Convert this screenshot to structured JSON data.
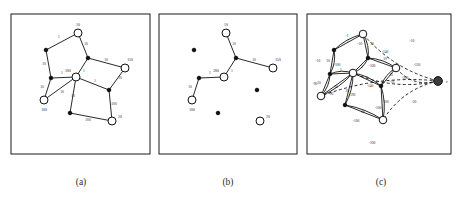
{
  "figure": {
    "width": 461,
    "height": 198,
    "background": "#ffffff",
    "ink": "#111111"
  },
  "captions": [
    {
      "id": "cap-a",
      "text": "(a)",
      "x": 81,
      "y": 185
    },
    {
      "id": "cap-b",
      "text": "(b)",
      "x": 228,
      "y": 185
    },
    {
      "id": "cap-c",
      "text": "(c)",
      "x": 381,
      "y": 185
    }
  ],
  "panels": [
    {
      "id": "panel-a",
      "caption": "(a)",
      "box": {
        "x": 11,
        "y": 14,
        "w": 139,
        "h": 140
      },
      "nodes": [
        {
          "id": "a-top",
          "x": 78,
          "y": 33,
          "type": "open",
          "r": 4.0,
          "label": "10",
          "lx": 78,
          "ly": 26
        },
        {
          "id": "a-ul",
          "x": 46,
          "y": 50,
          "type": "solid",
          "r": 1.8,
          "label": "",
          "lx": 0,
          "ly": 0
        },
        {
          "id": "a-mid",
          "x": 88,
          "y": 58,
          "type": "solid",
          "r": 1.8,
          "label": "",
          "lx": 0,
          "ly": 0
        },
        {
          "id": "a-right",
          "x": 125,
          "y": 68,
          "type": "open",
          "r": 4.0,
          "label": "150",
          "lx": 130,
          "ly": 61
        },
        {
          "id": "a-center",
          "x": 76,
          "y": 77,
          "type": "open",
          "r": 4.0,
          "label": "200",
          "lx": 68,
          "ly": 72
        },
        {
          "id": "a-left",
          "x": 51,
          "y": 78,
          "type": "solid",
          "r": 1.8,
          "label": "",
          "lx": 0,
          "ly": 0
        },
        {
          "id": "a-bl",
          "x": 44,
          "y": 100,
          "type": "open",
          "r": 4.0,
          "label": "100",
          "lx": 44,
          "ly": 111
        },
        {
          "id": "a-bc",
          "x": 70,
          "y": 113,
          "type": "solid",
          "r": 1.8,
          "label": "",
          "lx": 0,
          "ly": 0
        },
        {
          "id": "a-mr",
          "x": 109,
          "y": 90,
          "type": "solid",
          "r": 1.8,
          "label": "",
          "lx": 0,
          "ly": 0
        },
        {
          "id": "a-br",
          "x": 112,
          "y": 121,
          "type": "open",
          "r": 4.0,
          "label": "20",
          "lx": 120,
          "ly": 118
        }
      ],
      "edges": [
        {
          "from": "a-ul",
          "to": "a-top",
          "label": "1",
          "lx": 59,
          "ly": 38
        },
        {
          "from": "a-top",
          "to": "a-mid",
          "label": "10",
          "lx": 86,
          "ly": 45
        },
        {
          "from": "a-ul",
          "to": "a-left",
          "label": "10",
          "lx": 44,
          "ly": 65
        },
        {
          "from": "a-mid",
          "to": "a-right",
          "label": "10",
          "lx": 106,
          "ly": 61
        },
        {
          "from": "a-mid",
          "to": "a-center",
          "label": "1",
          "lx": 84,
          "ly": 72
        },
        {
          "from": "a-left",
          "to": "a-center",
          "label": "1",
          "lx": 62,
          "ly": 74
        },
        {
          "from": "a-left",
          "to": "a-bl",
          "label": "10",
          "lx": 42,
          "ly": 88
        },
        {
          "from": "a-center",
          "to": "a-bl",
          "label": "10",
          "lx": 62,
          "ly": 93
        },
        {
          "from": "a-center",
          "to": "a-bc",
          "label": "10",
          "lx": 73,
          "ly": 97
        },
        {
          "from": "a-center",
          "to": "a-mr",
          "label": "1",
          "lx": 95,
          "ly": 82
        },
        {
          "from": "a-mr",
          "to": "a-right",
          "label": "10",
          "lx": 120,
          "ly": 79
        },
        {
          "from": "a-mr",
          "to": "a-br",
          "label": "100",
          "lx": 114,
          "ly": 105
        },
        {
          "from": "a-bc",
          "to": "a-br",
          "label": "100",
          "lx": 88,
          "ly": 121
        }
      ]
    },
    {
      "id": "panel-b",
      "caption": "(b)",
      "box": {
        "x": 159,
        "y": 14,
        "w": 138,
        "h": 140
      },
      "nodes": [
        {
          "id": "b-top",
          "x": 226,
          "y": 33,
          "type": "open",
          "r": 4.0,
          "label": "10",
          "lx": 226,
          "ly": 26
        },
        {
          "id": "b-ul",
          "x": 194,
          "y": 50,
          "type": "solid",
          "r": 1.8,
          "label": "",
          "lx": 0,
          "ly": 0
        },
        {
          "id": "b-mid",
          "x": 236,
          "y": 58,
          "type": "solid",
          "r": 1.8,
          "label": "",
          "lx": 0,
          "ly": 0
        },
        {
          "id": "b-right",
          "x": 273,
          "y": 68,
          "type": "open",
          "r": 4.0,
          "label": "150",
          "lx": 278,
          "ly": 61
        },
        {
          "id": "b-center",
          "x": 224,
          "y": 77,
          "type": "open",
          "r": 4.0,
          "label": "200",
          "lx": 216,
          "ly": 72
        },
        {
          "id": "b-left",
          "x": 199,
          "y": 78,
          "type": "solid",
          "r": 1.8,
          "label": "",
          "lx": 0,
          "ly": 0
        },
        {
          "id": "b-bl",
          "x": 192,
          "y": 100,
          "type": "open",
          "r": 4.0,
          "label": "100",
          "lx": 192,
          "ly": 111
        },
        {
          "id": "b-bc",
          "x": 218,
          "y": 113,
          "type": "solid",
          "r": 1.8,
          "label": "",
          "lx": 0,
          "ly": 0
        },
        {
          "id": "b-mr",
          "x": 257,
          "y": 90,
          "type": "solid",
          "r": 1.8,
          "label": "",
          "lx": 0,
          "ly": 0
        },
        {
          "id": "b-br",
          "x": 260,
          "y": 121,
          "type": "open",
          "r": 4.0,
          "label": "20",
          "lx": 268,
          "ly": 118
        }
      ],
      "edges": [
        {
          "from": "b-top",
          "to": "b-mid",
          "label": "10",
          "lx": 234,
          "ly": 45
        },
        {
          "from": "b-mid",
          "to": "b-right",
          "label": "10",
          "lx": 254,
          "ly": 61
        },
        {
          "from": "b-mid",
          "to": "b-center",
          "label": "1",
          "lx": 232,
          "ly": 72
        },
        {
          "from": "b-left",
          "to": "b-center",
          "label": "1",
          "lx": 210,
          "ly": 74
        },
        {
          "from": "b-left",
          "to": "b-bl",
          "label": "10",
          "lx": 190,
          "ly": 88
        }
      ]
    },
    {
      "id": "panel-c",
      "caption": "(c)",
      "box": {
        "x": 307,
        "y": 14,
        "w": 144,
        "h": 140
      },
      "root": {
        "id": "c-root",
        "x": 438,
        "y": 81,
        "r": 4.4,
        "label": "r",
        "lx": 446,
        "ly": 83
      },
      "nodes": [
        {
          "id": "c-top",
          "x": 363,
          "y": 34,
          "type": "open",
          "r": 3.8,
          "label": "",
          "lx": 0,
          "ly": 0
        },
        {
          "id": "c-ul",
          "x": 334,
          "y": 50,
          "type": "solid",
          "r": 1.8,
          "label": "",
          "lx": 0,
          "ly": 0
        },
        {
          "id": "c-mid",
          "x": 368,
          "y": 58,
          "type": "solid",
          "r": 1.8,
          "label": "",
          "lx": 0,
          "ly": 0
        },
        {
          "id": "c-right",
          "x": 396,
          "y": 68,
          "type": "open",
          "r": 3.8,
          "label": "",
          "lx": 0,
          "ly": 0
        },
        {
          "id": "c-center",
          "x": 353,
          "y": 73,
          "type": "open",
          "r": 3.8,
          "label": "",
          "lx": 0,
          "ly": 0
        },
        {
          "id": "c-left",
          "x": 330,
          "y": 74,
          "type": "solid",
          "r": 1.8,
          "label": "",
          "lx": 0,
          "ly": 0
        },
        {
          "id": "c-bl",
          "x": 321,
          "y": 96,
          "type": "open",
          "r": 3.8,
          "label": "",
          "lx": 0,
          "ly": 0
        },
        {
          "id": "c-bc",
          "x": 345,
          "y": 105,
          "type": "solid",
          "r": 1.8,
          "label": "",
          "lx": 0,
          "ly": 0
        },
        {
          "id": "c-mr",
          "x": 381,
          "y": 86,
          "type": "solid",
          "r": 1.8,
          "label": "",
          "lx": 0,
          "ly": 0
        },
        {
          "id": "c-br",
          "x": 383,
          "y": 120,
          "type": "open",
          "r": 3.8,
          "label": "",
          "lx": 0,
          "ly": 0
        }
      ],
      "edges": [
        {
          "from": "c-ul",
          "to": "c-top",
          "label": "1",
          "lx": 348,
          "ly": 42,
          "style": "solid"
        },
        {
          "from": "c-top",
          "to": "c-mid",
          "label": "10",
          "lx": 372,
          "ly": 45,
          "style": "solid"
        },
        {
          "from": "c-ul",
          "to": "c-left",
          "label": "10",
          "lx": 328,
          "ly": 62,
          "style": "solid"
        },
        {
          "from": "c-mid",
          "to": "c-right",
          "label": "10",
          "lx": 385,
          "ly": 60,
          "style": "solid"
        },
        {
          "from": "c-mid",
          "to": "c-center",
          "label": "1",
          "lx": 362,
          "ly": 68,
          "style": "solid"
        },
        {
          "from": "c-left",
          "to": "c-center",
          "label": "1",
          "lx": 341,
          "ly": 71,
          "style": "solid"
        },
        {
          "from": "c-left",
          "to": "c-bl",
          "label": "10",
          "lx": 319,
          "ly": 84,
          "style": "solid"
        },
        {
          "from": "c-center",
          "to": "c-bl",
          "label": "10",
          "lx": 336,
          "ly": 88,
          "style": "solid"
        },
        {
          "from": "c-center",
          "to": "c-bc",
          "label": "10",
          "lx": 347,
          "ly": 92,
          "style": "solid"
        },
        {
          "from": "c-center",
          "to": "c-mr",
          "label": "1",
          "lx": 367,
          "ly": 79,
          "style": "solid"
        },
        {
          "from": "c-mr",
          "to": "c-right",
          "label": "10",
          "lx": 391,
          "ly": 76,
          "style": "solid"
        },
        {
          "from": "c-mr",
          "to": "c-br",
          "label": "100",
          "lx": 386,
          "ly": 103,
          "style": "solid"
        },
        {
          "from": "c-bc",
          "to": "c-br",
          "label": "60",
          "lx": 363,
          "ly": 113,
          "style": "solid"
        }
      ],
      "reverse_edges": [
        {
          "from": "c-top",
          "to": "c-ul",
          "label": "-1",
          "lx": 347,
          "ly": 37
        },
        {
          "from": "c-mid",
          "to": "c-top",
          "label": "-10",
          "lx": 360,
          "ly": 45
        },
        {
          "from": "c-left",
          "to": "c-ul",
          "label": "-10",
          "lx": 318,
          "ly": 62
        },
        {
          "from": "c-right",
          "to": "c-mid",
          "label": "-140",
          "lx": 385,
          "ly": 53
        },
        {
          "from": "c-center",
          "to": "c-mid",
          "label": "-100",
          "lx": 372,
          "ly": 67
        },
        {
          "from": "c-center",
          "to": "c-left",
          "label": "-100",
          "lx": 337,
          "ly": 66
        },
        {
          "from": "c-bl",
          "to": "c-left",
          "label": "-90",
          "lx": 315,
          "ly": 85
        },
        {
          "from": "c-bl",
          "to": "c-center",
          "label": "-90",
          "lx": 331,
          "ly": 95
        },
        {
          "from": "c-bc",
          "to": "c-center",
          "label": "-190",
          "lx": 352,
          "ly": 96
        },
        {
          "from": "c-mr",
          "to": "c-center",
          "label": "-140",
          "lx": 370,
          "ly": 87
        },
        {
          "from": "c-right",
          "to": "c-mr",
          "label": "-10",
          "lx": 392,
          "ly": 83
        },
        {
          "from": "c-br",
          "to": "c-mr",
          "label": "-100",
          "lx": 378,
          "ly": 109
        },
        {
          "from": "c-br",
          "to": "c-bc",
          "label": "-100",
          "lx": 356,
          "ly": 122
        }
      ],
      "root_edges": [
        {
          "to": "c-top",
          "label": "-10",
          "lx": 412,
          "ly": 42
        },
        {
          "to": "c-right",
          "label": "-150",
          "lx": 417,
          "ly": 66
        },
        {
          "to": "c-center",
          "label": "-200",
          "lx": 405,
          "ly": 79
        },
        {
          "to": "c-br",
          "label": "-20",
          "lx": 414,
          "ly": 103
        },
        {
          "to": "c-bl",
          "label": "-100",
          "lx": 372,
          "ly": 144
        }
      ]
    }
  ],
  "chart_data": {
    "type": "diagram",
    "panel_a": {
      "caption": "(a)",
      "node_labels": [
        "10",
        "150",
        "200",
        "100",
        "20"
      ],
      "edge_weights": [
        "1",
        "10",
        "10",
        "10",
        "1",
        "1",
        "10",
        "10",
        "10",
        "1",
        "10",
        "100",
        "100"
      ]
    },
    "panel_b": {
      "caption": "(b)",
      "node_labels": [
        "10",
        "150",
        "200",
        "100",
        "20"
      ],
      "edge_weights": [
        "10",
        "10",
        "1",
        "1",
        "10"
      ]
    },
    "panel_c": {
      "caption": "(c)",
      "root_label": "r",
      "forward_weights": [
        "1",
        "10",
        "10",
        "10",
        "1",
        "1",
        "10",
        "10",
        "10",
        "1",
        "10",
        "100",
        "60"
      ],
      "reverse_weights": [
        "-1",
        "-10",
        "-10",
        "-140",
        "-100",
        "-100",
        "-90",
        "-90",
        "-190",
        "-140",
        "-10",
        "-100",
        "-100"
      ],
      "root_arc_weights": [
        "-10",
        "-150",
        "-200",
        "-20",
        "-100"
      ]
    }
  }
}
